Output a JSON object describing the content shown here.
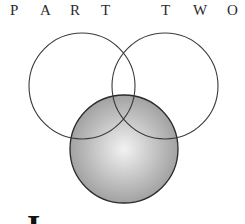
{
  "heading": {
    "word1": [
      "P",
      "A",
      "R",
      "T"
    ],
    "word2": [
      "T",
      "W",
      "O"
    ]
  },
  "diagram": {
    "type": "venn",
    "circles": [
      {
        "name": "left",
        "cx": 82,
        "cy": 86,
        "r": 53,
        "fill": "none",
        "stroke": "#3a3a3a"
      },
      {
        "name": "right",
        "cx": 165,
        "cy": 86,
        "r": 53,
        "fill": "none",
        "stroke": "#3a3a3a"
      },
      {
        "name": "bottom",
        "cx": 124,
        "cy": 149,
        "r": 54,
        "fill": "radial-gray",
        "stroke": "#2a2a2a"
      }
    ],
    "gradient": {
      "center": "#f2f2f2",
      "edge": "#9a9a9a"
    }
  },
  "body": {
    "dropcap": "I"
  }
}
